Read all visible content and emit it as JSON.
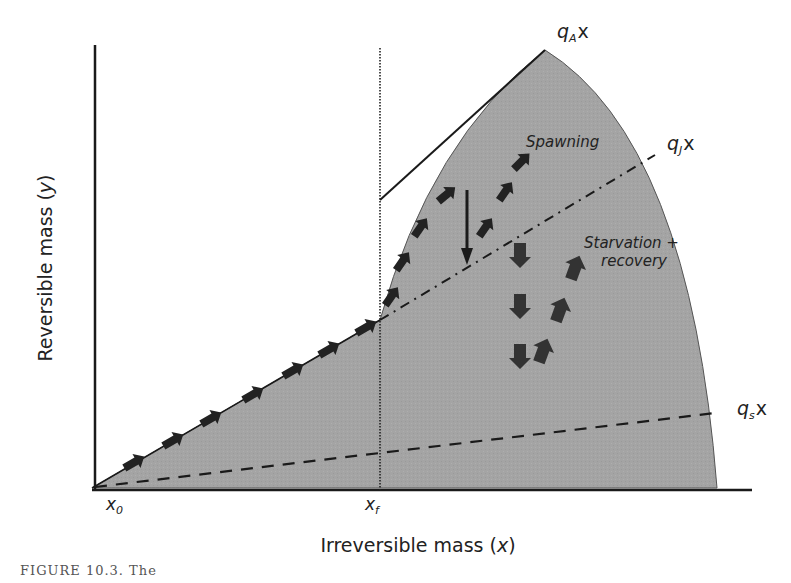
{
  "figure": {
    "y_axis_label": "Reversible mass (y)",
    "y_axis_label_prefix": "Reversible mass (",
    "y_axis_label_var": "y",
    "y_axis_label_suffix": ")",
    "x_axis_label_prefix": "Irreversible mass (",
    "x_axis_label_var": "x",
    "x_axis_label_suffix": ")",
    "ticks": {
      "x0": {
        "base": "x",
        "sub": "0"
      },
      "xf": {
        "base": "x",
        "sub": "f"
      }
    },
    "line_labels": {
      "qA": {
        "base": "q",
        "sub": "A",
        "tail": "x"
      },
      "qJ": {
        "base": "q",
        "sub": "J",
        "tail": "x"
      },
      "qs": {
        "base": "q",
        "sub": "s",
        "tail": "x"
      }
    },
    "annotations": {
      "spawning": "Spawning",
      "starvation_line1": "Starvation +",
      "starvation_line2": "recovery"
    },
    "caption": "FIGURE 10.3. The"
  },
  "colors": {
    "region_fill": "#a3a3a3",
    "line": "#1a1a1a",
    "arrow": "#2a2a2a",
    "text": "#222222"
  }
}
